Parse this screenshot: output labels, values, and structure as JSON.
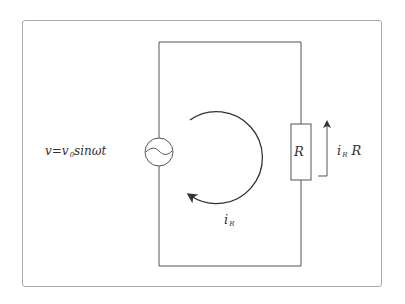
{
  "diagram": {
    "type": "AC circuit with resistor",
    "source_label": "v=v",
    "source_label_sub": "0",
    "source_label_rest": "sinωt",
    "resistor_label": "R",
    "voltage_label_main": "i",
    "voltage_label_sub": "R",
    "voltage_label_rest": " R",
    "current_label_main": "i",
    "current_label_sub": "R",
    "components": [
      "ac-voltage-source",
      "resistor"
    ],
    "colors": {
      "stroke": "#555555",
      "frame": "#a9a9a9",
      "text": "#333333"
    }
  }
}
